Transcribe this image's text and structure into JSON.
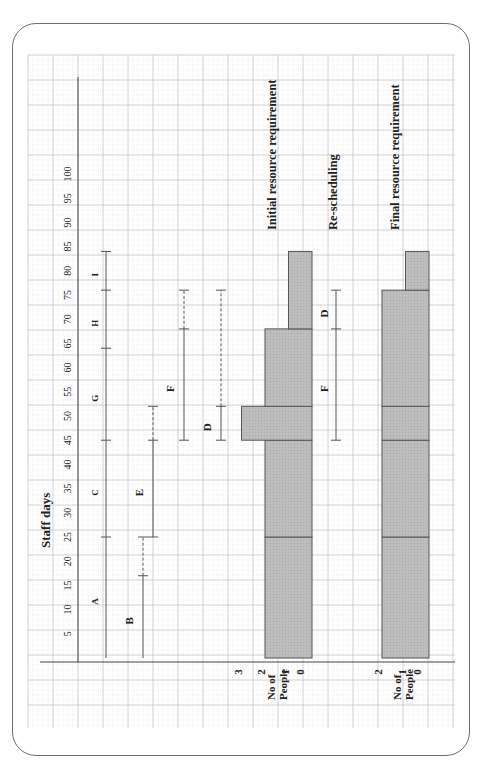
{
  "chart_data": {
    "type": "gantt_resource_histogram",
    "orientation": "rotated -90deg (time axis runs bottom-to-top)",
    "title": "Staff days",
    "xlabel": "Staff days",
    "x_ticks": [
      5,
      10,
      15,
      20,
      25,
      30,
      35,
      40,
      45,
      50,
      55,
      60,
      65,
      70,
      75,
      80,
      85,
      90,
      95,
      100
    ],
    "x_range": [
      0,
      100
    ],
    "grid": true,
    "activities": [
      {
        "row": "critical-path",
        "segments": [
          {
            "label": "A",
            "start": 0,
            "end": 25
          },
          {
            "label": "C",
            "start": 25,
            "end": 45
          },
          {
            "label": "G",
            "start": 45,
            "end": 64
          },
          {
            "label": "H",
            "start": 64,
            "end": 76
          },
          {
            "label": "I",
            "start": 76,
            "end": 84
          }
        ]
      },
      {
        "row": "B",
        "label": "B",
        "start": 0,
        "end": 17,
        "float_end": 25
      },
      {
        "row": "E",
        "label": "E",
        "start": 25,
        "end": 45,
        "float_end": 52
      },
      {
        "row": "F",
        "label": "F",
        "start": 45,
        "end": 68,
        "float_end": 76
      },
      {
        "row": "D",
        "label": "D",
        "start": 45,
        "end": 52,
        "float_end": 76
      }
    ],
    "initial_resource_requirement": {
      "title": "Initial resource requirement",
      "ylabel": "No of People",
      "y_ticks": [
        0,
        1,
        2,
        3
      ],
      "bars": [
        {
          "start": 0,
          "end": 25,
          "people": 2
        },
        {
          "start": 25,
          "end": 45,
          "people": 2
        },
        {
          "start": 45,
          "end": 52,
          "people": 3
        },
        {
          "start": 52,
          "end": 68,
          "people": 2
        },
        {
          "start": 68,
          "end": 84,
          "people": 1
        }
      ]
    },
    "rescheduling": {
      "title": "Re-scheduling",
      "segments": [
        {
          "label": "F",
          "start": 45,
          "end": 68
        },
        {
          "label": "D",
          "start": 68,
          "end": 76
        }
      ]
    },
    "final_resource_requirement": {
      "title": "Final resource requirement",
      "ylabel": "No of People",
      "y_ticks": [
        0,
        1,
        2
      ],
      "bars": [
        {
          "start": 0,
          "end": 25,
          "people": 2
        },
        {
          "start": 25,
          "end": 45,
          "people": 2
        },
        {
          "start": 45,
          "end": 52,
          "people": 2
        },
        {
          "start": 52,
          "end": 76,
          "people": 2
        },
        {
          "start": 76,
          "end": 84,
          "people": 1
        }
      ]
    }
  },
  "labels": {
    "axis_title": "Staff days",
    "initial_title": "Initial resource requirement",
    "resched_title": "Re-scheduling",
    "final_title": "Final resource requirement",
    "no_of": "No of",
    "people": "People"
  },
  "colors": {
    "bar_fill": "#b9b9b9",
    "bar_stroke": "#555555",
    "line": "#555555",
    "grid_minor": "#e3e3e3",
    "grid_major": "#c4c4c4",
    "frame": "#6d6d6d",
    "text": "#222222"
  }
}
